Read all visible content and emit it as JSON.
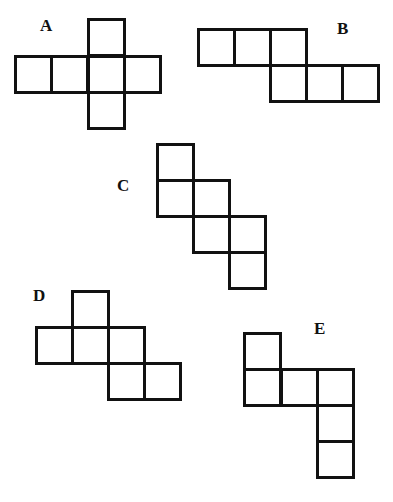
{
  "square_size": 37,
  "stroke_color": "#111111",
  "figures": [
    {
      "label": "A",
      "label_pos": [
        40,
        17
      ],
      "squares": [
        [
          87,
          18
        ],
        [
          14,
          55
        ],
        [
          50,
          55
        ],
        [
          87,
          55
        ],
        [
          123,
          55
        ],
        [
          87,
          91
        ]
      ]
    },
    {
      "label": "B",
      "label_pos": [
        337,
        20
      ],
      "squares": [
        [
          197,
          28
        ],
        [
          233,
          28
        ],
        [
          269,
          28
        ],
        [
          269,
          64
        ],
        [
          305,
          64
        ],
        [
          341,
          64
        ]
      ]
    },
    {
      "label": "C",
      "label_pos": [
        117,
        177
      ],
      "squares": [
        [
          156,
          143
        ],
        [
          156,
          179
        ],
        [
          192,
          179
        ],
        [
          192,
          215
        ],
        [
          228,
          215
        ],
        [
          228,
          251
        ]
      ]
    },
    {
      "label": "D",
      "label_pos": [
        33,
        287
      ],
      "squares": [
        [
          71,
          290
        ],
        [
          35,
          326
        ],
        [
          71,
          326
        ],
        [
          107,
          326
        ],
        [
          107,
          362
        ],
        [
          143,
          362
        ]
      ]
    },
    {
      "label": "E",
      "label_pos": [
        314,
        320
      ],
      "squares": [
        [
          243,
          332
        ],
        [
          243,
          368
        ],
        [
          280,
          368
        ],
        [
          316,
          368
        ],
        [
          316,
          404
        ],
        [
          316,
          440
        ]
      ]
    }
  ]
}
